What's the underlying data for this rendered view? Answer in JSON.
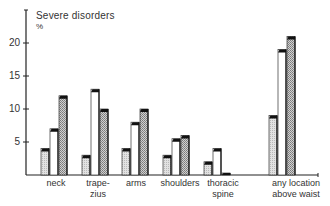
{
  "chart_data": {
    "type": "bar",
    "title": "Severe disorders",
    "ylabel": "%",
    "xlabel": "",
    "ylim": [
      0,
      22
    ],
    "yticks": [
      5,
      10,
      15,
      20
    ],
    "grid": false,
    "legend": null,
    "categories": [
      "neck",
      "trape-\nzius",
      "arms",
      "shoulders",
      "thoracic\nspine",
      "any location\nabove waist"
    ],
    "series": [
      {
        "name": "series 1 (light dotted)",
        "values": [
          4,
          3,
          4,
          3,
          2,
          9
        ]
      },
      {
        "name": "series 2 (white)",
        "values": [
          7,
          13,
          8,
          5.5,
          4,
          19
        ]
      },
      {
        "name": "series 3 (cross-hatched)",
        "values": [
          12,
          10,
          10,
          6,
          0.3,
          21
        ]
      }
    ]
  },
  "labels": {
    "title": "Severe disorders",
    "unit": "%",
    "yticks": [
      "5",
      "10",
      "15",
      "20"
    ],
    "categories": [
      "neck",
      "trape-\nzius",
      "arms",
      "shoulders",
      "thoracic\nspine",
      "any location\nabove waist"
    ]
  },
  "colors": {
    "axis": "#222222",
    "bar_top": "#111111",
    "series1_fill": "#d8d8d8",
    "series2_fill": "#ffffff",
    "series3_fill": "#bdbdbd"
  }
}
